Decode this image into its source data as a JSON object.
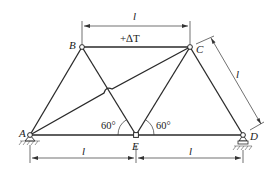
{
  "diagram": {
    "type": "truss",
    "nodes": [
      {
        "id": "A",
        "label": "A"
      },
      {
        "id": "B",
        "label": "B"
      },
      {
        "id": "C",
        "label": "C"
      },
      {
        "id": "D",
        "label": "D"
      },
      {
        "id": "E",
        "label": "E"
      }
    ],
    "members": [
      "AB",
      "BC",
      "CD",
      "AE",
      "ED",
      "BE",
      "CE",
      "AC"
    ],
    "supports": {
      "A": "pin",
      "D": "roller"
    },
    "top_dimension": "l",
    "temperature_label": "+∆T",
    "side_dimension": "l",
    "bottom_dimensions": [
      "l",
      "l"
    ],
    "angles": [
      "60°",
      "60°"
    ]
  }
}
